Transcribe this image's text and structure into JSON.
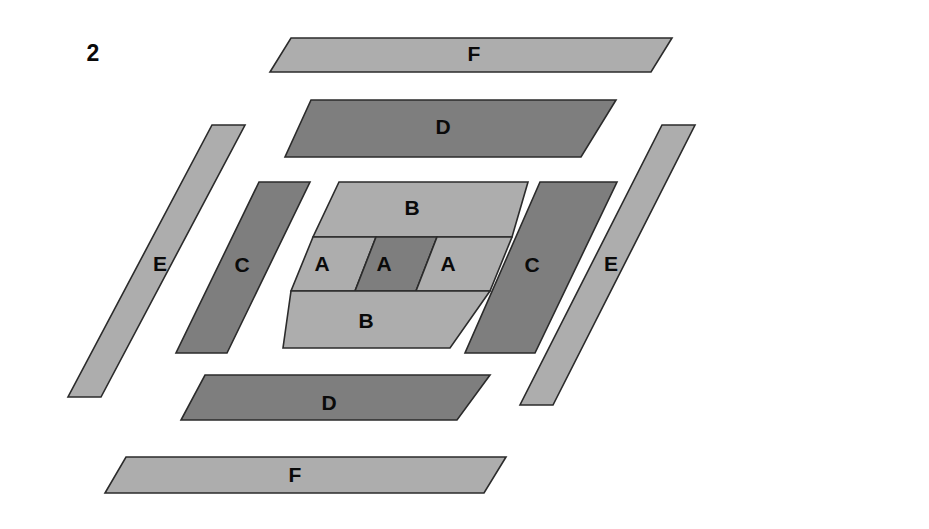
{
  "figure": {
    "panel_number": "2",
    "panel_number_position": {
      "x": 93,
      "y": 55
    },
    "background_color": "#ffffff",
    "outline_color": "#2b2b2b",
    "colors": {
      "light_gray": "#adadad",
      "dark_gray": "#7e7e7e"
    },
    "shapes": [
      {
        "id": "f-top",
        "label": "F",
        "tone": "light",
        "fill": "#adadad",
        "points": "291,38 672,38 651,72 270,72",
        "label_position": {
          "x": 474,
          "y": 55
        }
      },
      {
        "id": "d-top",
        "label": "D",
        "tone": "dark",
        "fill": "#7e7e7e",
        "points": "311,100 616,100 581,157 285,157",
        "label_position": {
          "x": 443,
          "y": 128
        }
      },
      {
        "id": "e-left",
        "label": "E",
        "tone": "light",
        "fill": "#adadad",
        "points": "212,125 245,125 101,397 68,397",
        "label_position": {
          "x": 160,
          "y": 265
        }
      },
      {
        "id": "c-left",
        "label": "C",
        "tone": "dark",
        "fill": "#7e7e7e",
        "points": "259,182 310,182 227,353 176,353",
        "label_position": {
          "x": 242,
          "y": 266
        }
      },
      {
        "id": "b-top",
        "label": "B",
        "tone": "light",
        "fill": "#adadad",
        "points": "339,182 528,182 512,237 313,237",
        "label_position": {
          "x": 412,
          "y": 209
        }
      },
      {
        "id": "a-left",
        "label": "A",
        "tone": "light",
        "fill": "#adadad",
        "points": "313,237 376,237 355,291 291,291",
        "label_position": {
          "x": 322,
          "y": 265
        }
      },
      {
        "id": "a-middle",
        "label": "A",
        "tone": "dark",
        "fill": "#7e7e7e",
        "points": "376,237 437,237 416,291 355,291",
        "label_position": {
          "x": 384,
          "y": 265
        }
      },
      {
        "id": "a-right",
        "label": "A",
        "tone": "light",
        "fill": "#adadad",
        "points": "437,237 512,237 490,291 416,291",
        "label_position": {
          "x": 448,
          "y": 265
        }
      },
      {
        "id": "b-bottom",
        "label": "B",
        "tone": "light",
        "fill": "#adadad",
        "points": "291,291 490,291 450,348 283,348",
        "label_position": {
          "x": 366,
          "y": 322
        }
      },
      {
        "id": "c-right",
        "label": "C",
        "tone": "dark",
        "fill": "#7e7e7e",
        "points": "540,182 617,182 535,353 465,353",
        "label_position": {
          "x": 532,
          "y": 266
        }
      },
      {
        "id": "e-right",
        "label": "E",
        "tone": "light",
        "fill": "#adadad",
        "points": "662,125 695,125 553,405 520,405",
        "label_position": {
          "x": 611,
          "y": 265
        }
      },
      {
        "id": "d-bottom",
        "label": "D",
        "tone": "dark",
        "fill": "#7e7e7e",
        "points": "205,375 490,375 457,420 181,420",
        "label_position": {
          "x": 329,
          "y": 404
        }
      },
      {
        "id": "f-bottom",
        "label": "F",
        "tone": "light",
        "fill": "#adadad",
        "points": "126,457 506,457 484,493 105,493",
        "label_position": {
          "x": 295,
          "y": 476
        }
      }
    ]
  }
}
